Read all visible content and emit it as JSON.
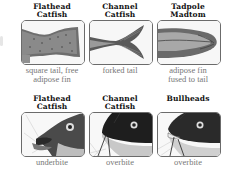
{
  "top_row": [
    {
      "title_line1": "Flathead",
      "title_line2": "Catfish",
      "caption_line1": "square tail, free",
      "caption_line2": "adipose fin",
      "image": "flathead-square-tail"
    },
    {
      "title_line1": "Channel",
      "title_line2": "Catfish",
      "caption_line1": "forked tail",
      "caption_line2": "",
      "image": "channel-forked-tail"
    },
    {
      "title_line1": "Tadpole",
      "title_line2": "Madtom",
      "caption_line1": "adipose fin",
      "caption_line2": "fused to tail",
      "image": "madtom-fused-adipose"
    }
  ],
  "bottom_row": [
    {
      "title_line1": "Flathead",
      "title_line2": "Catfish",
      "caption_line1": "underbite",
      "image": "flathead-head-underbite"
    },
    {
      "title_line1": "Channel",
      "title_line2": "Catfish",
      "caption_line1": "overbite",
      "image": "channel-head-overbite"
    },
    {
      "title_line1": "",
      "title_line2": "Bullheads",
      "caption_line1": "overbite",
      "image": "bullhead-head-overbite"
    }
  ]
}
